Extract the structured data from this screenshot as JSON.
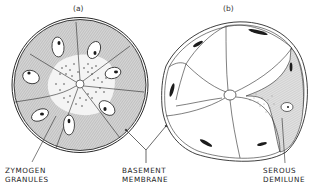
{
  "figure": {
    "panels": [
      {
        "id": "a",
        "label": "(a)"
      },
      {
        "id": "b",
        "label": "(b)"
      }
    ],
    "labels": {
      "zymogen_granules": {
        "line1": "ZYMOGEN",
        "line2": "GRANULES"
      },
      "basement_membrane": {
        "line1": "BASEMENT",
        "line2": "MEMBRANE"
      },
      "serous_demilune": {
        "line1": "SEROUS",
        "line2": "DEMILUNE"
      }
    },
    "colors": {
      "ink": "#2a2a2a",
      "shading": "#c9c9c9",
      "background": "#ffffff"
    }
  }
}
